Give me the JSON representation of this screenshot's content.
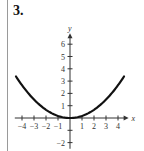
{
  "problem": {
    "number_label": "3."
  },
  "chart_data": {
    "type": "line",
    "title": "",
    "xlabel": "x",
    "ylabel": "y",
    "xlim": [
      -4.6,
      4.8
    ],
    "ylim": [
      -2.5,
      6.8
    ],
    "grid": false,
    "legend": null,
    "x_ticks": [
      -4,
      -3,
      -2,
      -1,
      1,
      2,
      3,
      4
    ],
    "x_tick_labels": [
      "−4",
      "−3",
      "−2",
      "−1",
      "1",
      "2",
      "3",
      "4"
    ],
    "y_ticks": [
      -2,
      -1,
      1,
      2,
      3,
      4,
      5,
      6
    ],
    "y_tick_labels": [
      "−2",
      "",
      "1",
      "2",
      "3",
      "4",
      "5",
      "6"
    ],
    "series": [
      {
        "name": "parabola",
        "equation": "y ≈ x²/6",
        "x": [
          -4.5,
          -4,
          -3,
          -2,
          -1,
          0,
          1,
          2,
          3,
          4,
          4.5
        ],
        "y": [
          3.38,
          2.67,
          1.5,
          0.67,
          0.17,
          0,
          0.17,
          0.67,
          1.5,
          2.67,
          3.38
        ]
      }
    ]
  }
}
